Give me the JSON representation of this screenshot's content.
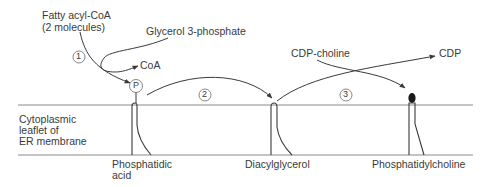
{
  "diagram": {
    "inputs": {
      "fatty_acyl_coa": "Fatty acyl-CoA",
      "fatty_acyl_coa_count": "(2 molecules)",
      "glycerol_3_phosphate": "Glycerol 3-phosphate",
      "coa": "CoA",
      "cdp_choline": "CDP-choline",
      "cdp": "CDP"
    },
    "steps": [
      {
        "number": "1"
      },
      {
        "number": "2"
      },
      {
        "number": "3"
      }
    ],
    "phosphate_symbol": "P",
    "membrane_label": [
      "Cytoplasmic",
      "leaflet of",
      "ER membrane"
    ],
    "products": [
      {
        "line1": "Phosphatidic",
        "line2": "acid"
      },
      {
        "line1": "Diacylglycerol",
        "line2": ""
      },
      {
        "line1": "Phosphatidylcholine",
        "line2": ""
      }
    ],
    "colors": {
      "line": "#3a3a3a",
      "membrane": "#8a8a8a",
      "text": "#3a3a3a"
    }
  }
}
